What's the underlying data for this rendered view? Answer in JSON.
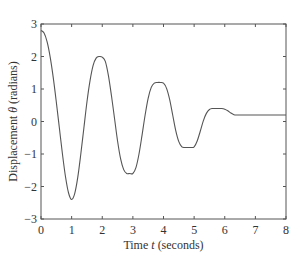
{
  "chart_data": {
    "type": "line",
    "title": "",
    "xlabel": "Time t (seconds)",
    "xlabel_parts": {
      "pre": "Time ",
      "var": "t",
      "post": " (seconds)"
    },
    "ylabel": "Displacement θ (radians)",
    "ylabel_parts": {
      "pre": "Displacement ",
      "var": "θ",
      "post": " (radians)"
    },
    "xlim": [
      0,
      8
    ],
    "ylim": [
      -3,
      3
    ],
    "xticks": [
      0,
      1,
      2,
      3,
      4,
      5,
      6,
      7,
      8
    ],
    "yticks": [
      -3,
      -2,
      -1,
      0,
      1,
      2,
      3
    ],
    "xtick_labels": [
      "0",
      "1",
      "2",
      "3",
      "4",
      "5",
      "6",
      "7",
      "8"
    ],
    "ytick_labels": [
      "−3",
      "−2",
      "−1",
      "0",
      "1",
      "2",
      "3"
    ],
    "grid": false,
    "legend": null,
    "series": [
      {
        "name": "Displacement",
        "color": "#555555",
        "x": [
          0,
          0.1,
          0.2,
          0.3,
          0.4,
          0.5,
          0.6,
          0.7,
          0.8,
          0.9,
          1.0,
          1.1,
          1.2,
          1.3,
          1.4,
          1.5,
          1.6,
          1.7,
          1.8,
          1.9,
          2.0,
          2.1,
          2.2,
          2.3,
          2.4,
          2.5,
          2.6,
          2.7,
          2.8,
          2.9,
          3.0,
          3.1,
          3.2,
          3.3,
          3.4,
          3.5,
          3.6,
          3.7,
          3.8,
          3.9,
          4.0,
          4.1,
          4.2,
          4.3,
          4.4,
          4.5,
          4.6,
          4.7,
          4.8,
          4.9,
          5.0,
          5.1,
          5.2,
          5.3,
          5.4,
          5.5,
          5.6,
          5.7,
          5.8,
          5.9,
          6.0,
          6.1,
          6.2,
          6.3,
          6.4,
          6.5,
          7.0,
          7.5,
          8.0
        ],
        "values": [
          2.8,
          2.72,
          2.45,
          1.98,
          1.35,
          0.6,
          -0.2,
          -1.0,
          -1.7,
          -2.2,
          -2.4,
          -2.22,
          -1.72,
          -1.0,
          -0.2,
          0.6,
          1.25,
          1.72,
          1.95,
          2.0,
          1.98,
          1.85,
          1.42,
          0.8,
          0.1,
          -0.6,
          -1.15,
          -1.48,
          -1.6,
          -1.6,
          -1.6,
          -1.42,
          -1.0,
          -0.42,
          0.2,
          0.72,
          1.05,
          1.18,
          1.2,
          1.2,
          1.18,
          1.02,
          0.68,
          0.2,
          -0.28,
          -0.62,
          -0.78,
          -0.8,
          -0.8,
          -0.8,
          -0.78,
          -0.6,
          -0.3,
          0.02,
          0.25,
          0.37,
          0.4,
          0.4,
          0.4,
          0.4,
          0.38,
          0.33,
          0.26,
          0.21,
          0.2,
          0.2,
          0.2,
          0.2,
          0.2
        ]
      }
    ],
    "annotations": []
  }
}
